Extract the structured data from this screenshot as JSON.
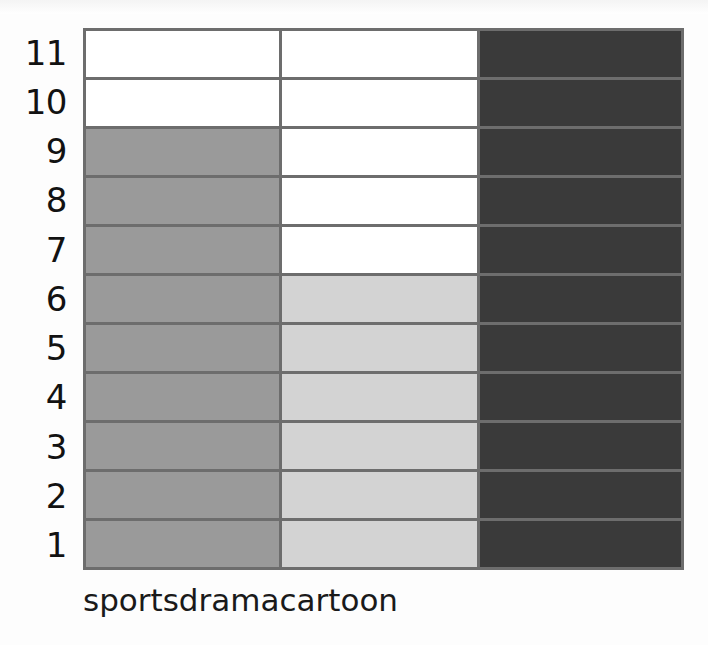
{
  "chart_data": {
    "type": "bar",
    "title": "",
    "subtitle": "",
    "xlabel": "",
    "ylabel": "",
    "categories": [
      "sports",
      "drama",
      "cartoon"
    ],
    "values": [
      9,
      6,
      11
    ],
    "series": [
      {
        "name": "count",
        "values": [
          9,
          6,
          11
        ]
      }
    ],
    "ylim": [
      0,
      11
    ],
    "y_ticks": [
      11,
      10,
      9,
      8,
      7,
      6,
      5,
      4,
      3,
      2,
      1
    ],
    "grid": true,
    "legend": "none",
    "orientation": "vertical",
    "bar_colors": [
      "#9a9a9a",
      "#d3d3d3",
      "#3a3a3a"
    ]
  },
  "axes": {
    "y_tick_labels": [
      "11",
      "10",
      "9",
      "8",
      "7",
      "6",
      "5",
      "4",
      "3",
      "2",
      "1"
    ],
    "x_tick_labels": [
      "sports",
      "drama",
      "cartoon"
    ]
  },
  "style": {
    "grid_color": "#6d6d6d",
    "frame_color": "#6d6d6d",
    "plot_background": "#ffffff",
    "page_background": "#fdfdfd",
    "label_color": "#121212"
  }
}
